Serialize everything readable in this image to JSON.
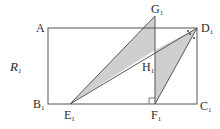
{
  "diagram": {
    "figure_label": {
      "name": "R",
      "sub": "1"
    },
    "points": {
      "A": {
        "name": "A",
        "sub": "",
        "x": 48,
        "y": 28
      },
      "B1": {
        "name": "B",
        "sub": "1",
        "x": 48,
        "y": 104
      },
      "C1": {
        "name": "C",
        "sub": "1",
        "x": 197,
        "y": 104
      },
      "D1": {
        "name": "D",
        "sub": "1",
        "x": 197,
        "y": 28
      },
      "E1": {
        "name": "E",
        "sub": "1",
        "x": 70,
        "y": 104
      },
      "F1": {
        "name": "F",
        "sub": "1",
        "x": 155,
        "y": 104
      },
      "G1": {
        "name": "G",
        "sub": "1",
        "x": 155,
        "y": 16
      },
      "H1": {
        "name": "H",
        "sub": "1",
        "x": 155,
        "y": 50
      }
    },
    "shaded_regions": [
      "triangle E1-G1-F1 (left of H1)",
      "triangle F1-D1 region"
    ],
    "colors": {
      "line": "#555555",
      "fill": "#cfcfcf",
      "text": "#2a2a2a"
    }
  }
}
